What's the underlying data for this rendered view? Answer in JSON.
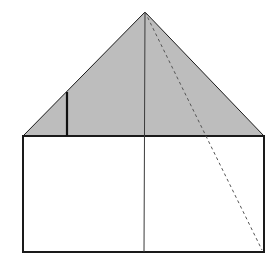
{
  "diagram": {
    "type": "geometric-figure",
    "colors": {
      "triangle_fill": "#bdbdbd",
      "stroke": "#1a1a1a",
      "thin_line": "#3a3a3a",
      "dashed_line": "#555555",
      "background": "#ffffff"
    },
    "points": {
      "apex": [
        145,
        12
      ],
      "base_left": [
        23,
        136
      ],
      "base_right": [
        264,
        136
      ],
      "rect_bottom_left": [
        23,
        252
      ],
      "rect_bottom_right": [
        264,
        252
      ],
      "center_top": [
        145,
        12
      ],
      "center_bottom": [
        144,
        252
      ],
      "short_line_top": [
        67,
        92
      ],
      "short_line_bottom": [
        67,
        136
      ],
      "dash_start": [
        145,
        12
      ],
      "dash_end": [
        262,
        250
      ]
    },
    "labels": []
  }
}
